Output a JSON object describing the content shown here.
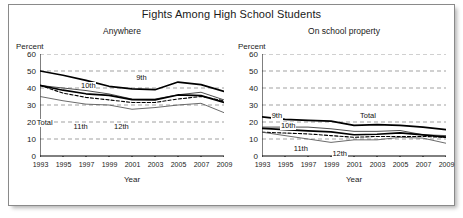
{
  "figure": {
    "title": "Fights Among High School Students",
    "x_axis_title": "Year",
    "y_axis_unit_label": "Percent"
  },
  "panels": [
    {
      "key": "anywhere",
      "subtitle": "Anywhere"
    },
    {
      "key": "school",
      "subtitle": "On school property"
    }
  ],
  "axis": {
    "y_ticks": [
      "0",
      "10",
      "20",
      "30",
      "40",
      "50",
      "60"
    ],
    "x_ticks": [
      "1993",
      "1995",
      "1997",
      "1999",
      "2001",
      "2003",
      "2005",
      "2007",
      "2009"
    ]
  },
  "series_labels": {
    "total": "Total",
    "ninth": "9th",
    "tenth": "10th",
    "eleventh": "11th",
    "twelfth": "12th"
  },
  "chart_data": [
    {
      "type": "line",
      "title": "Fights Among High School Students",
      "subtitle": "Anywhere",
      "xlabel": "Year",
      "ylabel": "Percent",
      "x": [
        1993,
        1995,
        1997,
        1999,
        2001,
        2003,
        2005,
        2007,
        2009
      ],
      "xlim": [
        1993,
        2009
      ],
      "ylim": [
        0,
        60
      ],
      "ytick_step": 10,
      "grid": "horizontal-dashed",
      "legend": "inline-annotations",
      "series": [
        {
          "name": "9th",
          "values": [
            50.0,
            47.5,
            44.5,
            41.0,
            39.5,
            39.0,
            43.5,
            42.0,
            38.0
          ]
        },
        {
          "name": "10th",
          "values": [
            41.5,
            40.0,
            38.5,
            36.5,
            33.5,
            33.5,
            36.0,
            37.5,
            33.0
          ]
        },
        {
          "name": "Total",
          "values": [
            41.5,
            38.7,
            36.6,
            35.7,
            33.2,
            33.0,
            35.9,
            35.5,
            31.5
          ]
        },
        {
          "name": "11th",
          "values": [
            41.5,
            37.0,
            34.5,
            33.0,
            31.5,
            31.5,
            33.5,
            35.0,
            32.5
          ]
        },
        {
          "name": "12th",
          "values": [
            35.0,
            32.5,
            30.5,
            30.0,
            27.5,
            28.5,
            30.0,
            31.0,
            25.5
          ]
        }
      ]
    },
    {
      "type": "line",
      "title": "Fights Among High School Students",
      "subtitle": "On school property",
      "xlabel": "Year",
      "ylabel": "Percent",
      "x": [
        1993,
        1995,
        1997,
        1999,
        2001,
        2003,
        2005,
        2007,
        2009
      ],
      "xlim": [
        1993,
        2009
      ],
      "ylim": [
        0,
        60
      ],
      "ytick_step": 10,
      "grid": "horizontal-dashed",
      "legend": "inline-annotations",
      "series": [
        {
          "name": "9th",
          "values": [
            23.0,
            21.5,
            21.0,
            20.5,
            18.0,
            18.5,
            18.0,
            17.0,
            15.5
          ]
        },
        {
          "name": "10th",
          "values": [
            17.0,
            17.0,
            17.0,
            16.0,
            14.5,
            14.5,
            15.0,
            12.5,
            12.0
          ]
        },
        {
          "name": "Total",
          "values": [
            16.2,
            15.5,
            14.8,
            14.2,
            12.5,
            12.8,
            13.6,
            12.4,
            11.1
          ]
        },
        {
          "name": "11th",
          "values": [
            14.0,
            13.5,
            13.0,
            12.0,
            11.0,
            11.5,
            11.5,
            11.5,
            11.0
          ]
        },
        {
          "name": "12th",
          "values": [
            14.0,
            12.0,
            10.0,
            8.0,
            9.5,
            9.5,
            11.0,
            10.5,
            7.5
          ]
        }
      ]
    }
  ],
  "annotations": {
    "anywhere": [
      {
        "name": "9th",
        "x_pct": 52,
        "y_pct": 20
      },
      {
        "name": "10th",
        "x_pct": 22,
        "y_pct": 27
      },
      {
        "name": "Total",
        "x_pct": -2,
        "y_pct": 64
      },
      {
        "name": "11th",
        "x_pct": 18,
        "y_pct": 68
      },
      {
        "name": "12th",
        "x_pct": 40,
        "y_pct": 68
      }
    ],
    "school": [
      {
        "name": "9th",
        "x_pct": 5,
        "y_pct": 57
      },
      {
        "name": "10th",
        "x_pct": 10,
        "y_pct": 67
      },
      {
        "name": "Total",
        "x_pct": 53,
        "y_pct": 57
      },
      {
        "name": "11th",
        "x_pct": 17,
        "y_pct": 89
      },
      {
        "name": "12th",
        "x_pct": 38,
        "y_pct": 94
      }
    ]
  },
  "colors": {
    "line": "#000000",
    "grid": "#7a7a7a",
    "axis": "#000000",
    "text": "#1a1a1a",
    "frame": "#8a8a8a",
    "background": "#ffffff"
  }
}
